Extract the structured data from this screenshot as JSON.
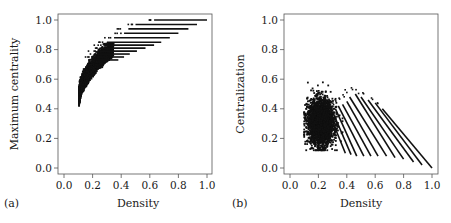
{
  "chart_data": [
    {
      "type": "scatter",
      "panel_label": "(a)",
      "title": "",
      "xlabel": "Density",
      "ylabel": "Maximum centrality",
      "xlim": [
        0.0,
        1.0
      ],
      "ylim": [
        0.0,
        1.0
      ],
      "xticks": [
        "0.0",
        "0.2",
        "0.4",
        "0.6",
        "0.8",
        "1.0"
      ],
      "yticks": [
        "0.0",
        "0.2",
        "0.4",
        "0.6",
        "0.8",
        "1.0"
      ],
      "grid": false,
      "legend": null,
      "description": "Dense cloud of points rising from about (0.11, 0.45) curving up to about (0.3, 0.8), then fanning out into horizontal streaks of constant maximum centrality extending to the right.",
      "cloud_envelope": {
        "lower": [
          [
            0.11,
            0.45
          ],
          [
            0.13,
            0.52
          ],
          [
            0.16,
            0.6
          ],
          [
            0.2,
            0.65
          ],
          [
            0.25,
            0.7
          ],
          [
            0.3,
            0.73
          ]
        ],
        "upper": [
          [
            0.11,
            0.5
          ],
          [
            0.12,
            0.6
          ],
          [
            0.15,
            0.7
          ],
          [
            0.2,
            0.77
          ],
          [
            0.25,
            0.8
          ],
          [
            0.3,
            0.82
          ]
        ]
      },
      "streaks": [
        {
          "y": 1.0,
          "x_start": 0.63,
          "x_end": 1.0
        },
        {
          "y": 0.97,
          "x_start": 0.5,
          "x_end": 0.93
        },
        {
          "y": 0.94,
          "x_start": 0.45,
          "x_end": 0.87
        },
        {
          "y": 0.91,
          "x_start": 0.42,
          "x_end": 0.8
        },
        {
          "y": 0.88,
          "x_start": 0.35,
          "x_end": 0.74
        },
        {
          "y": 0.85,
          "x_start": 0.3,
          "x_end": 0.68
        },
        {
          "y": 0.83,
          "x_start": 0.29,
          "x_end": 0.63
        },
        {
          "y": 0.81,
          "x_start": 0.27,
          "x_end": 0.57
        },
        {
          "y": 0.79,
          "x_start": 0.25,
          "x_end": 0.51
        },
        {
          "y": 0.77,
          "x_start": 0.24,
          "x_end": 0.46
        },
        {
          "y": 0.75,
          "x_start": 0.23,
          "x_end": 0.42
        },
        {
          "y": 0.73,
          "x_start": 0.22,
          "x_end": 0.38
        }
      ]
    },
    {
      "type": "scatter",
      "panel_label": "(b)",
      "title": "",
      "xlabel": "Density",
      "ylabel": "Centralization",
      "xlim": [
        0.0,
        1.0
      ],
      "ylim": [
        0.0,
        1.0
      ],
      "xticks": [
        "0.0",
        "0.2",
        "0.4",
        "0.6",
        "0.8",
        "1.0"
      ],
      "yticks": [
        "0.0",
        "0.2",
        "0.4",
        "0.6",
        "0.8",
        "1.0"
      ],
      "grid": false,
      "legend": null,
      "description": "Dense oval cloud centered near (0.22, 0.3) spanning density 0.1-0.35 and centralization 0.12-0.55, with parallel descending diagonal streaks extending to the lower right, the last reaching (1.0, 0.0).",
      "cloud": {
        "center": [
          0.22,
          0.3
        ],
        "x_range": [
          0.1,
          0.36
        ],
        "y_range": [
          0.12,
          0.6
        ]
      },
      "diagonals": [
        {
          "start": [
            0.65,
            0.4
          ],
          "end": [
            1.0,
            0.0
          ]
        },
        {
          "start": [
            0.6,
            0.44
          ],
          "end": [
            0.93,
            0.02
          ]
        },
        {
          "start": [
            0.55,
            0.46
          ],
          "end": [
            0.87,
            0.04
          ]
        },
        {
          "start": [
            0.5,
            0.48
          ],
          "end": [
            0.8,
            0.06
          ]
        },
        {
          "start": [
            0.46,
            0.5
          ],
          "end": [
            0.74,
            0.07
          ]
        },
        {
          "start": [
            0.42,
            0.48
          ],
          "end": [
            0.68,
            0.08
          ]
        },
        {
          "start": [
            0.4,
            0.45
          ],
          "end": [
            0.62,
            0.08
          ]
        },
        {
          "start": [
            0.37,
            0.43
          ],
          "end": [
            0.57,
            0.08
          ]
        },
        {
          "start": [
            0.34,
            0.42
          ],
          "end": [
            0.52,
            0.08
          ]
        },
        {
          "start": [
            0.32,
            0.4
          ],
          "end": [
            0.47,
            0.08
          ]
        },
        {
          "start": [
            0.3,
            0.38
          ],
          "end": [
            0.43,
            0.09
          ]
        },
        {
          "start": [
            0.28,
            0.36
          ],
          "end": [
            0.39,
            0.1
          ]
        }
      ]
    }
  ]
}
